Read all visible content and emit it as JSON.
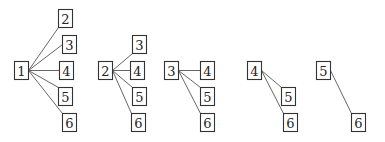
{
  "diagram": {
    "title": "",
    "node_size": {
      "w": 14,
      "h": 18
    },
    "groups": [
      {
        "id": "group-1",
        "root": {
          "label": "1",
          "x": 14,
          "y": 61
        },
        "children": [
          {
            "label": "2",
            "x": 58,
            "y": 9,
            "attach": "bottom-left"
          },
          {
            "label": "3",
            "x": 62,
            "y": 35,
            "attach": "left-mid"
          },
          {
            "label": "4",
            "x": 59,
            "y": 61,
            "attach": "left-mid"
          },
          {
            "label": "5",
            "x": 58,
            "y": 87,
            "attach": "top-left"
          },
          {
            "label": "6",
            "x": 62,
            "y": 113,
            "attach": "top-left"
          }
        ]
      },
      {
        "id": "group-2",
        "root": {
          "label": "2",
          "x": 98,
          "y": 61
        },
        "children": [
          {
            "label": "3",
            "x": 132,
            "y": 35,
            "attach": "bottom-left"
          },
          {
            "label": "4",
            "x": 130,
            "y": 61,
            "attach": "left-mid"
          },
          {
            "label": "5",
            "x": 132,
            "y": 87,
            "attach": "top-left"
          },
          {
            "label": "6",
            "x": 131,
            "y": 113,
            "attach": "top-left"
          }
        ]
      },
      {
        "id": "group-3",
        "root": {
          "label": "3",
          "x": 164,
          "y": 61
        },
        "children": [
          {
            "label": "4",
            "x": 200,
            "y": 61,
            "attach": "left-mid"
          },
          {
            "label": "5",
            "x": 200,
            "y": 87,
            "attach": "top-left"
          },
          {
            "label": "6",
            "x": 200,
            "y": 113,
            "attach": "top-left"
          }
        ]
      },
      {
        "id": "group-4",
        "root": {
          "label": "4",
          "x": 247,
          "y": 61
        },
        "children": [
          {
            "label": "5",
            "x": 281,
            "y": 87,
            "attach": "top-left"
          },
          {
            "label": "6",
            "x": 283,
            "y": 113,
            "attach": "top-left"
          }
        ]
      },
      {
        "id": "group-5",
        "root": {
          "label": "5",
          "x": 316,
          "y": 61
        },
        "children": [
          {
            "label": "6",
            "x": 351,
            "y": 113,
            "attach": "top-left"
          }
        ]
      }
    ]
  }
}
